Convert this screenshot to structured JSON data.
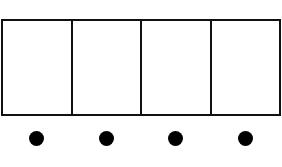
{
  "diagram": {
    "cells": [
      {
        "label": ""
      },
      {
        "label": ""
      },
      {
        "label": ""
      },
      {
        "label": ""
      }
    ],
    "dots": [
      {
        "cx": 36
      },
      {
        "cx": 106
      },
      {
        "cx": 175
      },
      {
        "cx": 245
      }
    ],
    "colors": {
      "stroke": "#111111",
      "dot": "#000000",
      "background": "#ffffff"
    }
  }
}
